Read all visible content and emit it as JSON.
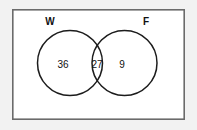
{
  "figure": {
    "type": "venn-diagram",
    "set_count": 2,
    "background_color": "#f2f2f2",
    "universe_fill": "#ffffff",
    "universe_stroke": "#6b6b6b",
    "circle_stroke": "#1c1c1c",
    "text_color": "#111111"
  },
  "sets": [
    {
      "label": "W",
      "label_x": 50,
      "label_y": 22
    },
    {
      "label": "F",
      "label_x": 146,
      "label_y": 22
    }
  ],
  "regions": [
    {
      "name": "w-only",
      "value": "36",
      "x": 63,
      "y": 65
    },
    {
      "name": "intersection",
      "value": "27",
      "x": 97,
      "y": 65
    },
    {
      "name": "f-only",
      "value": "9",
      "x": 122,
      "y": 65
    }
  ],
  "geometry": {
    "universe": {
      "x": 12,
      "y": 9,
      "width": 173,
      "height": 111
    },
    "circle_left": {
      "cx": 70,
      "cy": 63,
      "r": 32.5
    },
    "circle_right": {
      "cx": 124.5,
      "cy": 63,
      "r": 32.5
    }
  }
}
